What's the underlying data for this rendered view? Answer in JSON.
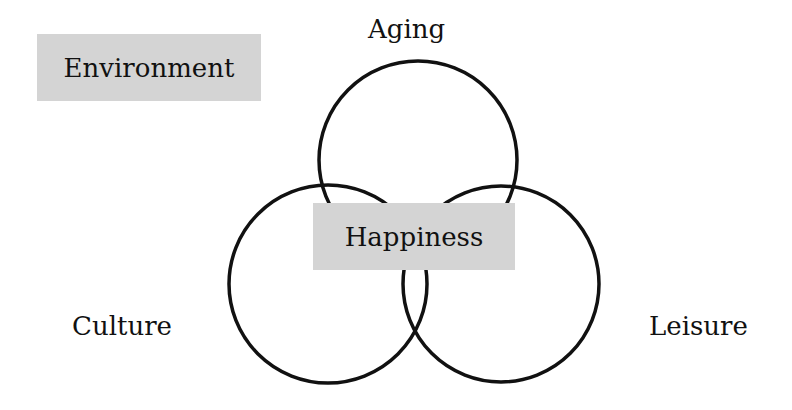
{
  "diagram": {
    "type": "venn",
    "title_box": {
      "label": "Environment"
    },
    "center_box": {
      "label": "Happiness"
    },
    "sets": [
      {
        "name": "Aging",
        "position": "top"
      },
      {
        "name": "Culture",
        "position": "bottom-left"
      },
      {
        "name": "Leisure",
        "position": "bottom-right"
      }
    ],
    "colors": {
      "stroke": "#111111",
      "box_fill": "#d4d4d4",
      "background": "#ffffff"
    }
  }
}
